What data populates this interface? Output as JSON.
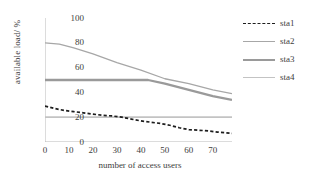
{
  "chart_data": {
    "type": "line",
    "title": "",
    "xlabel": "number of access users",
    "ylabel": "available load/ %",
    "xlim": [
      0,
      78
    ],
    "ylim": [
      0,
      100
    ],
    "xticks": [
      0,
      10,
      20,
      30,
      40,
      50,
      60,
      70
    ],
    "yticks": [
      0,
      20,
      40,
      60,
      80,
      100
    ],
    "grid": false,
    "legend_position": "right",
    "series": [
      {
        "name": "sta1",
        "style": "dashed",
        "color": "#1d1d1d",
        "x": [
          0,
          4,
          8,
          12,
          16,
          20,
          24,
          28,
          32,
          36,
          40,
          44,
          48,
          52,
          56,
          60,
          64,
          68,
          72,
          78
        ],
        "values": [
          29,
          27,
          25.5,
          24.5,
          23.5,
          22.5,
          21.5,
          21,
          20,
          18.5,
          17,
          16,
          15,
          13.5,
          11.5,
          10,
          9.5,
          9,
          8,
          7
        ]
      },
      {
        "name": "sta2",
        "style": "solid",
        "color": "#a7a7a7",
        "x": [
          0,
          6,
          12,
          20,
          30,
          40,
          50,
          60,
          70,
          78
        ],
        "values": [
          80,
          79,
          76,
          71,
          64,
          58,
          51,
          47,
          42,
          39
        ]
      },
      {
        "name": "sta3",
        "style": "solid",
        "color": "#9a9a9a",
        "x": [
          0,
          20,
          40,
          43,
          50,
          60,
          70,
          78
        ],
        "values": [
          50,
          50,
          50,
          50,
          47,
          42,
          37,
          34
        ]
      },
      {
        "name": "sta4",
        "style": "solid",
        "color": "#c3c3c3",
        "x": [
          0,
          20,
          40,
          60,
          78
        ],
        "values": [
          20,
          20,
          20,
          20,
          20
        ]
      }
    ]
  },
  "legend": {
    "items": [
      {
        "label": "sta1"
      },
      {
        "label": "sta2"
      },
      {
        "label": "sta3"
      },
      {
        "label": "sta4"
      }
    ]
  }
}
